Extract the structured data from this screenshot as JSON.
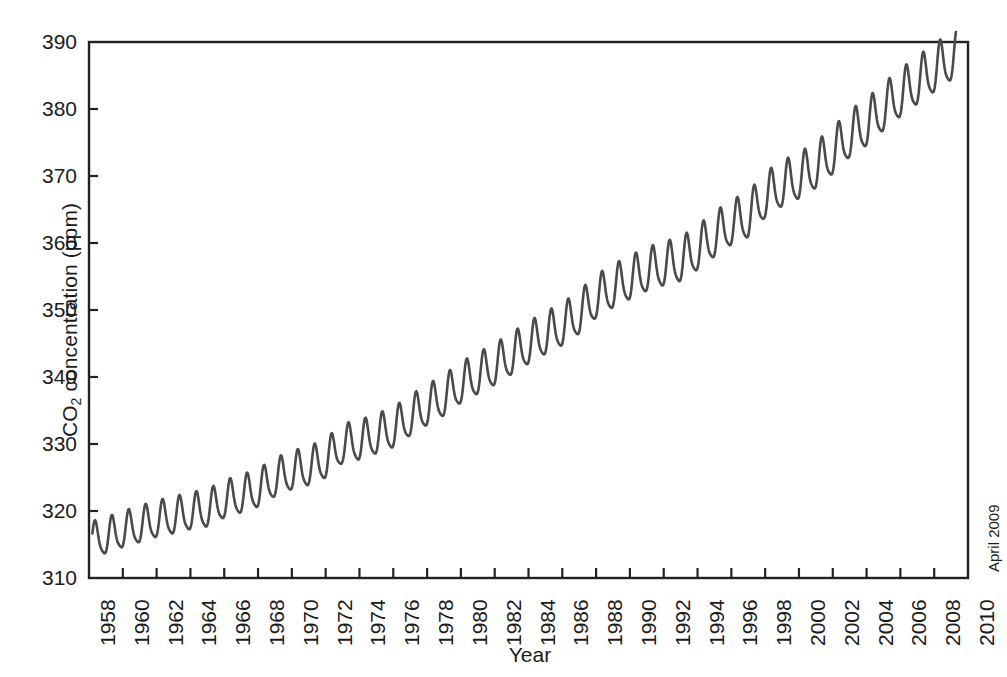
{
  "chart_data": {
    "type": "line",
    "title": "",
    "xlabel": "Year",
    "ylabel": "CO2 concentration (ppm)",
    "ylabel_parts": {
      "pre": "CO",
      "sub": "2",
      "post": " concentration (ppm)"
    },
    "xlim": [
      1958,
      2010
    ],
    "ylim": [
      310,
      390
    ],
    "grid": false,
    "legend": false,
    "line_color": "#4a4a4a",
    "axis_color": "#222222",
    "background": "#ffffff",
    "xticks": [
      1958,
      1960,
      1962,
      1964,
      1966,
      1968,
      1970,
      1972,
      1974,
      1976,
      1978,
      1980,
      1982,
      1984,
      1986,
      1988,
      1990,
      1992,
      1994,
      1996,
      1998,
      2000,
      2002,
      2004,
      2006,
      2008,
      2010
    ],
    "xtick_labels": [
      "1958",
      "1960",
      "1962",
      "1964",
      "1966",
      "1968",
      "1970",
      "1972",
      "1974",
      "1976",
      "1978",
      "1980",
      "1982",
      "1984",
      "1986",
      "1988",
      "1990",
      "1992",
      "1994",
      "1996",
      "1998",
      "2000",
      "2002",
      "2004",
      "2006",
      "2008",
      "2010"
    ],
    "yticks": [
      310,
      320,
      330,
      340,
      350,
      360,
      370,
      380,
      390
    ],
    "ytick_labels": [
      "310",
      "320",
      "330",
      "340",
      "350",
      "360",
      "370",
      "380",
      "390"
    ],
    "annotations": [
      {
        "text": "April 2009",
        "position": "right-outside-bottom",
        "rotation": -90
      }
    ],
    "series_name": "Mauna Loa atmospheric CO2 (Keeling Curve)",
    "seasonal_amplitude_ppm": 6.0,
    "annual_mean_x": [
      1958,
      1959,
      1960,
      1961,
      1962,
      1963,
      1964,
      1965,
      1966,
      1967,
      1968,
      1969,
      1970,
      1971,
      1972,
      1973,
      1974,
      1975,
      1976,
      1977,
      1978,
      1979,
      1980,
      1981,
      1982,
      1983,
      1984,
      1985,
      1986,
      1987,
      1988,
      1989,
      1990,
      1991,
      1992,
      1993,
      1994,
      1995,
      1996,
      1997,
      1998,
      1999,
      2000,
      2001,
      2002,
      2003,
      2004,
      2005,
      2006,
      2007,
      2008,
      2009
    ],
    "annual_mean_y": [
      315.3,
      315.98,
      316.91,
      317.64,
      318.45,
      318.99,
      319.62,
      320.04,
      321.38,
      322.16,
      323.04,
      324.62,
      325.68,
      326.32,
      327.45,
      329.68,
      330.18,
      331.11,
      332.04,
      333.83,
      335.4,
      336.84,
      338.75,
      340.11,
      341.45,
      343.05,
      344.65,
      346.12,
      347.42,
      349.19,
      351.57,
      353.12,
      354.39,
      355.61,
      356.45,
      357.1,
      358.83,
      360.82,
      362.61,
      363.73,
      366.7,
      368.38,
      369.55,
      371.14,
      373.28,
      375.8,
      377.52,
      379.8,
      381.9,
      383.79,
      385.6,
      387.4
    ]
  }
}
